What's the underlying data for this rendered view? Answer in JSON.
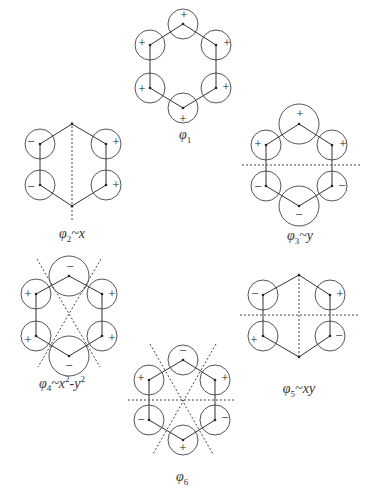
{
  "header": {
    "text": "ORBITALS"
  },
  "diagrams": [
    {
      "id": "phi1",
      "label_base": "φ",
      "label_sub": "1",
      "label_suffix": "",
      "signs": [
        "+",
        "+",
        "+",
        "+",
        "+",
        "+"
      ]
    },
    {
      "id": "phi2",
      "label_base": "φ",
      "label_sub": "2",
      "label_suffix": "~x",
      "signs": [
        "−",
        "+",
        "−",
        "+"
      ]
    },
    {
      "id": "phi3",
      "label_base": "φ",
      "label_sub": "3",
      "label_suffix": "~y",
      "signs": [
        "+",
        "+",
        "+",
        "−",
        "−",
        "−"
      ]
    },
    {
      "id": "phi4",
      "label_base": "φ",
      "label_sub": "4",
      "label_suffix": "~x",
      "label_sup1": "2",
      "label_mid": "-y",
      "label_sup2": "2",
      "signs": [
        "−",
        "+",
        "+",
        "+",
        "+",
        "−"
      ]
    },
    {
      "id": "phi5",
      "label_base": "φ",
      "label_sub": "5",
      "label_suffix": "~xy",
      "signs": [
        "−",
        "+",
        "+",
        "−"
      ]
    },
    {
      "id": "phi6",
      "label_base": "φ",
      "label_sub": "6",
      "label_suffix": "",
      "signs": [
        "−",
        "+",
        "+",
        "−",
        "−",
        "+"
      ]
    }
  ],
  "colors": {
    "line": "#333333",
    "circle": "#555555",
    "dash": "#444444"
  }
}
